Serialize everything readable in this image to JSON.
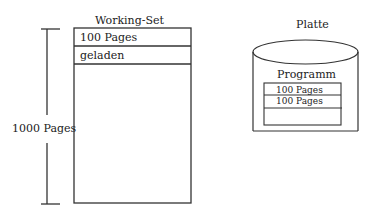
{
  "working_set": {
    "title": "Working-Set",
    "rows": [
      "100 Pages",
      "geladen"
    ]
  },
  "scale": {
    "label": "1000 Pages"
  },
  "disk": {
    "title": "Platte",
    "program": {
      "label": "Programm",
      "rows": [
        "100 Pages",
        "100 Pages",
        ""
      ]
    }
  },
  "colors": {
    "line": "#333333",
    "text": "#222222",
    "background": "#ffffff"
  }
}
